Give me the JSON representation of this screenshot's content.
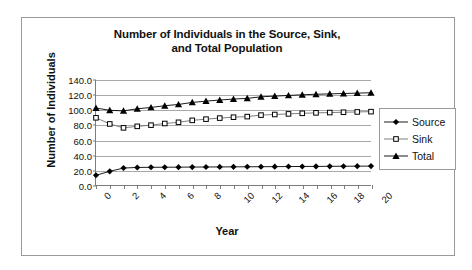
{
  "chart_data": {
    "type": "line",
    "title": "Number of Individuals in the Source, Sink, and Total Population",
    "title_line1": "Number of Individuals in the Source, Sink,",
    "title_line2": "and Total Population",
    "xlabel": "Year",
    "ylabel": "Number of Individuals",
    "x": [
      0,
      1,
      2,
      3,
      4,
      5,
      6,
      7,
      8,
      9,
      10,
      11,
      12,
      13,
      14,
      15,
      16,
      17,
      18,
      19,
      20
    ],
    "xtick_labels": [
      "0",
      "2",
      "4",
      "6",
      "8",
      "10",
      "12",
      "14",
      "16",
      "18",
      "20"
    ],
    "xtick_values": [
      0,
      2,
      4,
      6,
      8,
      10,
      12,
      14,
      16,
      18,
      20
    ],
    "ytick_labels": [
      "140.0",
      "120.0",
      "100.0",
      "80.0",
      "60.0",
      "40.0",
      "20.0",
      "0.0"
    ],
    "ytick_values": [
      140,
      120,
      100,
      80,
      60,
      40,
      20,
      0
    ],
    "xlim": [
      0,
      20
    ],
    "ylim": [
      0,
      140
    ],
    "grid": "horizontal",
    "legend_position": "right",
    "series": [
      {
        "name": "Source",
        "marker": "filled-diamond",
        "values": [
          13.0,
          18.2,
          22.6,
          23.4,
          23.6,
          23.7,
          23.8,
          23.9,
          24.0,
          24.1,
          24.2,
          24.3,
          24.4,
          24.5,
          24.6,
          24.7,
          24.8,
          24.9,
          25.0,
          25.1,
          25.2
        ]
      },
      {
        "name": "Sink",
        "marker": "open-square",
        "values": [
          89.6,
          81.4,
          76.2,
          78.2,
          79.8,
          82.0,
          83.6,
          86.2,
          87.8,
          89.2,
          90.4,
          91.2,
          93.2,
          94.0,
          94.8,
          95.6,
          96.2,
          96.6,
          97.0,
          97.4,
          97.8
        ]
      },
      {
        "name": "Total",
        "marker": "filled-triangle",
        "values": [
          102.6,
          99.6,
          98.8,
          101.6,
          103.4,
          105.7,
          107.4,
          110.1,
          111.8,
          113.3,
          114.6,
          115.5,
          117.6,
          118.5,
          119.4,
          120.3,
          121.0,
          121.5,
          122.0,
          122.5,
          123.0
        ]
      }
    ],
    "colors": {
      "series": "#000000",
      "gridline": "#a9a9a9",
      "axis": "#7d7d7d",
      "border": "#9a9a9a",
      "background": "#ffffff",
      "text": "#111111"
    }
  },
  "legend": {
    "items": [
      {
        "label": "Source",
        "marker": "filled-diamond"
      },
      {
        "label": "Sink",
        "marker": "open-square"
      },
      {
        "label": "Total",
        "marker": "filled-triangle"
      }
    ]
  }
}
